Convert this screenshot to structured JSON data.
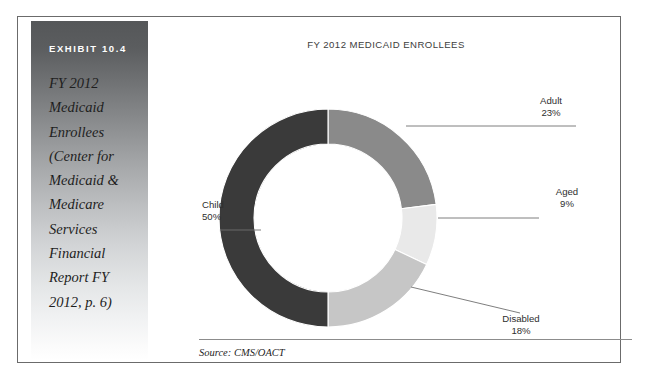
{
  "exhibit": {
    "number_label": "EXHIBIT 10.4",
    "caption": "FY 2012 Medicaid Enrollees (Center for Medicaid & Medicare Services Financial Report FY 2012, p. 6)"
  },
  "source": {
    "note": "Source: CMS/OACT"
  },
  "colors": {
    "child": "#3a3a3a",
    "adult": "#8a8a8a",
    "aged": "#e9e9e9",
    "disabled": "#c6c6c6",
    "frame": "#6b6b6b",
    "leader_line": "#6f6f6f",
    "title_text": "#3d3d3d",
    "label_text": "#2e2e2e"
  },
  "chart_data": {
    "type": "pie",
    "variant": "donut",
    "title": "FY 2012 MEDICAID ENROLLEES",
    "xlabel": "",
    "ylabel": "",
    "legend": "none",
    "grid": false,
    "units": "percent",
    "total": 100,
    "categories": [
      "Child",
      "Adult",
      "Aged",
      "Disabled"
    ],
    "values": [
      50,
      23,
      9,
      18
    ],
    "slices": [
      {
        "label": "Child",
        "value": 50,
        "value_label": "50%",
        "color": "#3a3a3a"
      },
      {
        "label": "Adult",
        "value": 23,
        "value_label": "23%",
        "color": "#8a8a8a"
      },
      {
        "label": "Aged",
        "value": 9,
        "value_label": "9%",
        "color": "#e9e9e9"
      },
      {
        "label": "Disabled",
        "value": 18,
        "value_label": "18%",
        "color": "#c6c6c6"
      }
    ],
    "annotations": [
      "Source: CMS/OACT"
    ]
  }
}
